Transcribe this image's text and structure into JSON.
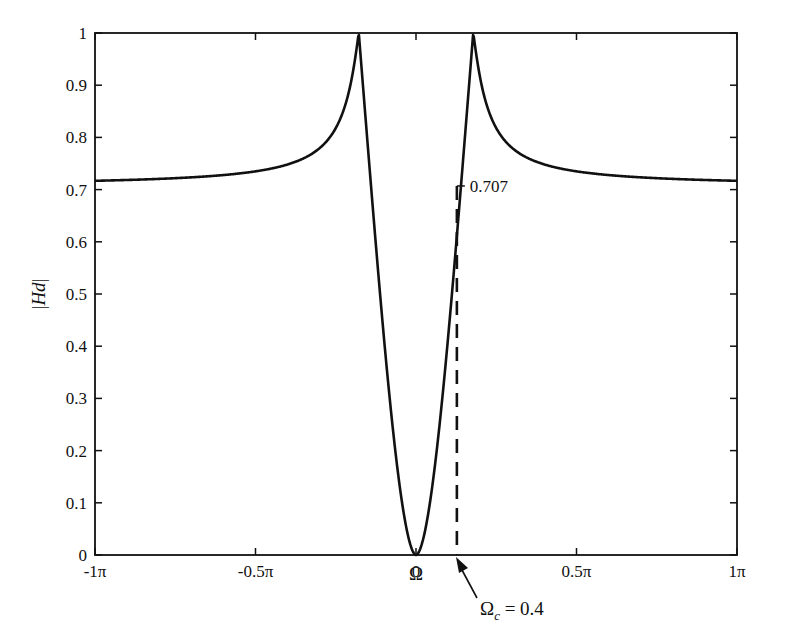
{
  "chart_data": {
    "type": "line",
    "title": "",
    "xlabel": "Ω",
    "ylabel": "|Hd|",
    "xlim": [
      -3.14159,
      3.14159
    ],
    "ylim": [
      0,
      1
    ],
    "grid": false,
    "legend": null,
    "x_ticks": [
      {
        "value": -3.14159,
        "label": "-1π"
      },
      {
        "value": -1.5708,
        "label": "-0.5π"
      },
      {
        "value": 0,
        "label": "0"
      },
      {
        "value": 1.5708,
        "label": "0.5π"
      },
      {
        "value": 3.14159,
        "label": "1π"
      }
    ],
    "y_ticks": [
      {
        "value": 0,
        "label": "0"
      },
      {
        "value": 0.1,
        "label": "0.1"
      },
      {
        "value": 0.2,
        "label": "0.2"
      },
      {
        "value": 0.3,
        "label": "0.3"
      },
      {
        "value": 0.4,
        "label": "0.4"
      },
      {
        "value": 0.5,
        "label": "0.5"
      },
      {
        "value": 0.6,
        "label": "0.6"
      },
      {
        "value": 0.7,
        "label": "0.7"
      },
      {
        "value": 0.8,
        "label": "0.8"
      },
      {
        "value": 0.9,
        "label": "0.9"
      },
      {
        "value": 1,
        "label": "1"
      }
    ],
    "series": [
      {
        "name": "|Hd|",
        "style": "solid",
        "x": [
          -3.14,
          -2.5,
          -2.0,
          -1.5,
          -1.2,
          -1.0,
          -0.8,
          -0.7,
          -0.6,
          -0.56,
          -0.5,
          -0.4,
          -0.3,
          -0.2,
          -0.1,
          0,
          0.1,
          0.2,
          0.3,
          0.4,
          0.5,
          0.56,
          0.6,
          0.7,
          0.8,
          1.0,
          1.2,
          1.5,
          2.0,
          2.5,
          3.14
        ],
        "y": [
          0.71,
          0.712,
          0.717,
          0.73,
          0.75,
          0.78,
          0.84,
          0.89,
          0.97,
          1.0,
          0.95,
          0.707,
          0.42,
          0.18,
          0.045,
          0,
          0.045,
          0.18,
          0.42,
          0.707,
          0.95,
          1.0,
          0.97,
          0.89,
          0.84,
          0.78,
          0.75,
          0.73,
          0.717,
          0.712,
          0.71
        ]
      }
    ],
    "annotations": [
      {
        "type": "dashed-vline",
        "x": 0.4,
        "y_from": 0,
        "y_to": 0.707
      },
      {
        "type": "text",
        "text": "0.707",
        "x": 0.4,
        "y": 0.707
      },
      {
        "type": "arrow",
        "text_main": "Ω",
        "text_sub": "c",
        "text_rest": " = 0.4",
        "points_to_x": 0.4,
        "points_to_y": 0
      }
    ]
  },
  "labels": {
    "xlabel": "Ω",
    "ylabel_bar_left": "|",
    "ylabel_italic": "Hd",
    "ylabel_bar_right": "|",
    "annotation_value": "0.707",
    "cutoff_main": "Ω",
    "cutoff_sub": "c",
    "cutoff_rest": " = 0.4"
  },
  "curve_model": {
    "a": 0.56,
    "tail": 0.707,
    "width": 0.22
  }
}
